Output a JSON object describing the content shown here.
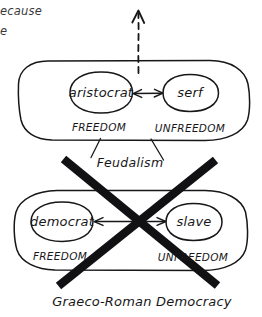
{
  "figure": {
    "kind": "hand-drawn-concept-diagram",
    "ink_color": "#17171a",
    "paper_color": "#ffffff",
    "cross_out_color": "#111114"
  },
  "margin_note": {
    "line1": "ecause",
    "line2": "e"
  },
  "groups": [
    {
      "id": "feudalism",
      "caption": "Feudalism",
      "crossed_out": false,
      "nodes": [
        {
          "id": "aristocrat",
          "label": "aristocrat",
          "state": "FREEDOM"
        },
        {
          "id": "serf",
          "label": "serf",
          "state": "UNFREEDOM"
        }
      ],
      "relation": "bidirectional-arrow"
    },
    {
      "id": "graeco-roman-democracy",
      "caption": "Graeco-Roman Democracy",
      "crossed_out": true,
      "nodes": [
        {
          "id": "democrat",
          "label": "democrat",
          "state": "FREEDOM"
        },
        {
          "id": "slave",
          "label": "slave",
          "state": "UNFREEDOM"
        }
      ],
      "relation": "bidirectional-arrow"
    }
  ],
  "annotations": {
    "upward_dashed_arrow": "progression-riser",
    "cross_out_mark": "X"
  }
}
